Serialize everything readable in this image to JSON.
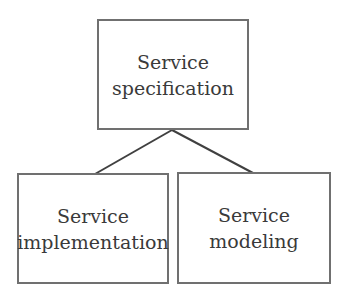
{
  "diagram": {
    "type": "hierarchy",
    "root": {
      "id": "spec",
      "line1": "Service",
      "line2": "specification"
    },
    "children": [
      {
        "id": "impl",
        "line1": "Service",
        "line2": "implementation"
      },
      {
        "id": "model",
        "line1": "Service",
        "line2": "modeling"
      }
    ],
    "edges": [
      {
        "from": "spec",
        "to": "impl"
      },
      {
        "from": "spec",
        "to": "model"
      }
    ],
    "colors": {
      "border": "#707070",
      "text": "#3a3a3a",
      "line": "#404040",
      "background": "#ffffff"
    }
  }
}
